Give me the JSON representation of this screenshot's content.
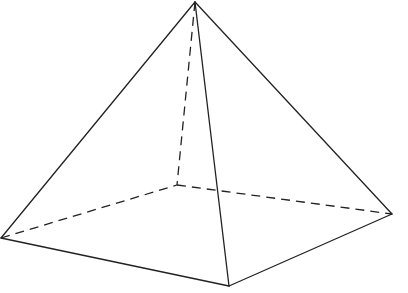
{
  "figure": {
    "background": "#ffffff",
    "stroke_color": "#222222",
    "vertices": {
      "apex": [
        195,
        2
      ],
      "left": [
        1,
        238
      ],
      "front": [
        229,
        286
      ],
      "right": [
        392,
        214
      ],
      "back": [
        177,
        185
      ]
    },
    "visible_edges": [
      [
        "apex",
        "left"
      ],
      [
        "apex",
        "front"
      ],
      [
        "apex",
        "right"
      ],
      [
        "left",
        "front"
      ],
      [
        "front",
        "right"
      ]
    ],
    "hidden_edges": [
      [
        "apex",
        "back"
      ],
      [
        "left",
        "back"
      ],
      [
        "back",
        "right"
      ]
    ]
  }
}
